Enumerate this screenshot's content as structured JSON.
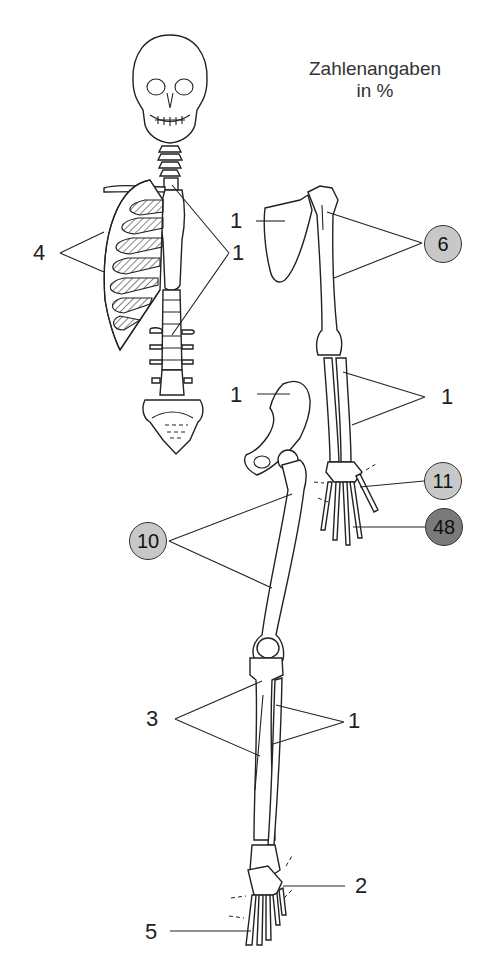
{
  "caption": {
    "line1": "Zahlenangaben",
    "line2": "in %"
  },
  "labels": {
    "ribs": "4",
    "cervical_spine": "1",
    "thoracic_spine": "1",
    "scapula": "1",
    "pelvis": "1",
    "forearm": "1",
    "fibula": "1",
    "tibia": "3",
    "tarsus": "2",
    "toes": "5"
  },
  "badges": {
    "humerus": {
      "value": "6",
      "shade": "light",
      "color": "#c8c8c8"
    },
    "wrist": {
      "value": "11",
      "shade": "light",
      "color": "#c8c8c8"
    },
    "fingers": {
      "value": "48",
      "shade": "dark",
      "color": "#7a7a7a"
    },
    "femur": {
      "value": "10",
      "shade": "light",
      "color": "#c8c8c8"
    }
  }
}
